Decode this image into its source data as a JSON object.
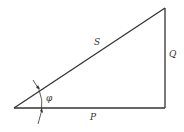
{
  "diagram": {
    "type": "power triangle",
    "labels": {
      "hypotenuse": "S",
      "vertical": "Q",
      "horizontal": "P",
      "angle": "φ"
    },
    "colors": {
      "line": "#333333",
      "background": "#ffffff"
    }
  }
}
